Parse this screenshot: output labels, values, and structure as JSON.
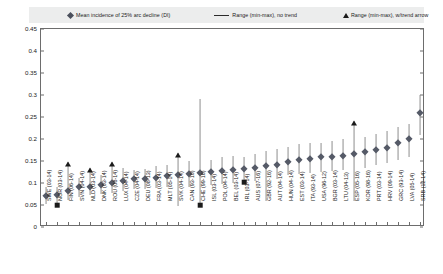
{
  "legend": {
    "items": [
      {
        "id": "mean",
        "marker": "diamond-marker",
        "label": "Mean incidence of 25% arc decline (DI)"
      },
      {
        "id": "range_no_trend",
        "marker": "line-marker",
        "label": "Range (min-max), no trend"
      },
      {
        "id": "range_trend",
        "marker": "triangle-marker",
        "label": "Range (min-max), w/trend arrow"
      }
    ]
  },
  "axes": {
    "y": {
      "ticks": [
        "0",
        "0.05",
        "0.1",
        "0.15",
        "0.2",
        "0.25",
        "0.3",
        "0.35",
        "0.4",
        "0.45"
      ],
      "min": 0,
      "max": 0.45,
      "step": 0.05,
      "label": ""
    },
    "x": {
      "label": ""
    }
  },
  "chart_data": {
    "type": "scatter",
    "title": "",
    "xlabel": "",
    "ylabel": "",
    "ylim": [
      0,
      0.45
    ],
    "grid": false,
    "legend_position": "top",
    "categories": [
      "SWE (03-14)",
      "NOR (03-14)",
      "FIN (06-14)",
      "SVN (04-14)",
      "NLD (03-14)",
      "DNK (03-14)",
      "ROU (08-14)",
      "LUX (04-14)",
      "CZE (04-14)",
      "DEU (08-13)",
      "FRA (03-14)",
      "MLT (05-14)",
      "SVK (04-14)",
      "CAN (93-10)",
      "CHE (99-16)",
      "ISL (03-14)",
      "POL (04-14)",
      "BEL (03-14)",
      "IRL (03-14)",
      "AUS (07-16)",
      "GBR (92-16)",
      "AUT (04-14)",
      "HUN (04-14)",
      "EST (03-14)",
      "ITA (93-14)",
      "USA (96-12)",
      "BGR (03-14)",
      "LTU (04-13)",
      "ESP (05-16)",
      "KOR (98-16)",
      "PRT (03-14)",
      "HRV (09-14)",
      "GRC (93-14)",
      "LVA (05-14)",
      "SRB (12-14)"
    ],
    "series": [
      {
        "name": "Mean incidence of 25% arc decline (DI)",
        "marker": "diamond",
        "values": [
          0.07,
          0.072,
          0.082,
          0.09,
          0.092,
          0.095,
          0.1,
          0.105,
          0.108,
          0.11,
          0.112,
          0.115,
          0.118,
          0.12,
          0.122,
          0.125,
          0.128,
          0.13,
          0.132,
          0.135,
          0.138,
          0.142,
          0.148,
          0.152,
          0.155,
          0.158,
          0.16,
          0.162,
          0.165,
          0.17,
          0.175,
          0.18,
          0.19,
          0.2,
          0.258
        ]
      },
      {
        "name": "Range min",
        "values": [
          0.052,
          0.05,
          0.062,
          0.068,
          0.072,
          0.075,
          0.078,
          0.082,
          0.086,
          0.086,
          0.088,
          0.09,
          0.048,
          0.092,
          0.05,
          0.096,
          0.098,
          0.1,
          0.102,
          0.105,
          0.06,
          0.11,
          0.118,
          0.12,
          0.122,
          0.125,
          0.128,
          0.13,
          0.058,
          0.135,
          0.14,
          0.145,
          0.152,
          0.16,
          0.208
        ]
      },
      {
        "name": "Range max",
        "values": [
          0.09,
          0.092,
          0.148,
          0.112,
          0.135,
          0.118,
          0.148,
          0.135,
          0.13,
          0.132,
          0.138,
          0.14,
          0.168,
          0.15,
          0.29,
          0.152,
          0.158,
          0.162,
          0.16,
          0.165,
          0.172,
          0.178,
          0.182,
          0.188,
          0.19,
          0.192,
          0.196,
          0.2,
          0.24,
          0.205,
          0.212,
          0.218,
          0.228,
          0.235,
          0.3
        ]
      },
      {
        "name": "Trend arrow present",
        "values": [
          false,
          false,
          true,
          false,
          true,
          false,
          true,
          false,
          false,
          false,
          false,
          false,
          true,
          false,
          false,
          false,
          false,
          false,
          false,
          false,
          false,
          false,
          false,
          false,
          false,
          false,
          false,
          false,
          true,
          false,
          false,
          false,
          false,
          false,
          false
        ]
      },
      {
        "name": "Square marker at min",
        "values": [
          false,
          true,
          false,
          false,
          false,
          false,
          false,
          false,
          false,
          false,
          false,
          false,
          false,
          false,
          true,
          false,
          false,
          false,
          true,
          false,
          false,
          false,
          false,
          false,
          false,
          false,
          false,
          false,
          false,
          false,
          false,
          false,
          false,
          false,
          false
        ]
      }
    ]
  }
}
